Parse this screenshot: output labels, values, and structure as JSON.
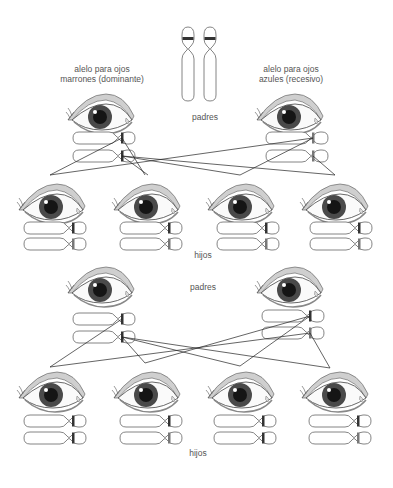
{
  "labels": {
    "brown_allele": [
      "alelo para ojos",
      "marrones (dominante)"
    ],
    "blue_allele": [
      "alelo para ojos",
      "azules (recesivo)"
    ],
    "parents_top": "padres",
    "children_top": "hijos",
    "parents_bottom": "padres",
    "children_bottom": "hijos"
  },
  "colors": {
    "iris_brown": "#4a4a4a",
    "pupil": "#111111",
    "line": "#222222",
    "text": "#555555"
  },
  "crosses": [
    {
      "name": "cross-1",
      "parents": [
        {
          "position": "left",
          "alleles": [
            "dominant",
            "dominant"
          ]
        },
        {
          "position": "right",
          "alleles": [
            "recessive",
            "recessive"
          ]
        }
      ],
      "children": [
        {
          "alleles": [
            "dominant",
            "recessive"
          ]
        },
        {
          "alleles": [
            "dominant",
            "recessive"
          ]
        },
        {
          "alleles": [
            "dominant",
            "recessive"
          ]
        },
        {
          "alleles": [
            "dominant",
            "recessive"
          ]
        }
      ]
    },
    {
      "name": "cross-2",
      "parents": [
        {
          "position": "left",
          "alleles": [
            "dominant",
            "dominant"
          ]
        },
        {
          "position": "right",
          "alleles": [
            "dominant",
            "recessive"
          ]
        }
      ],
      "children": [
        {
          "alleles": [
            "dominant",
            "dominant"
          ]
        },
        {
          "alleles": [
            "dominant",
            "recessive"
          ]
        },
        {
          "alleles": [
            "dominant",
            "dominant"
          ]
        },
        {
          "alleles": [
            "dominant",
            "recessive"
          ]
        }
      ]
    }
  ]
}
